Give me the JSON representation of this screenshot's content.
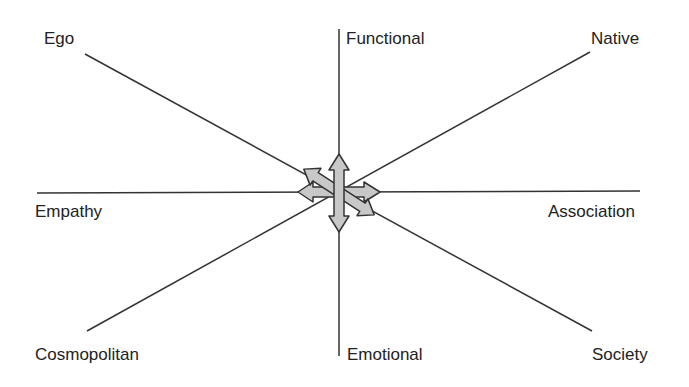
{
  "diagram": {
    "type": "eight-direction axis diagram",
    "center": {
      "x": 339,
      "y": 192
    },
    "axes": [
      {
        "name": "vertical",
        "ends": [
          "Functional",
          "Emotional"
        ]
      },
      {
        "name": "horizontal",
        "ends": [
          "Empathy",
          "Association"
        ]
      },
      {
        "name": "diagonal-down",
        "ends": [
          "Ego",
          "Society"
        ]
      },
      {
        "name": "diagonal-up",
        "ends": [
          "Native",
          "Cosmopolitan"
        ]
      }
    ],
    "labels": {
      "ego": "Ego",
      "functional": "Functional",
      "native": "Native",
      "empathy": "Empathy",
      "association": "Association",
      "cosmopolitan": "Cosmopolitan",
      "emotional": "Emotional",
      "society": "Society"
    },
    "center_arrows": [
      "vertical double arrow",
      "horizontal double arrow",
      "diagonal double arrow (Ego–Society)"
    ],
    "colors": {
      "line": "#333333",
      "arrow_fill": "#c8c8c8",
      "arrow_stroke": "#333333"
    }
  }
}
